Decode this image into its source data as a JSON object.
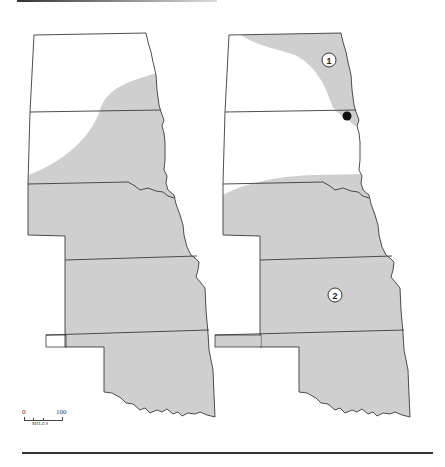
{
  "figure": {
    "type": "paired-range-map",
    "states": [
      "North Dakota",
      "South Dakota",
      "Nebraska",
      "Kansas",
      "Oklahoma"
    ],
    "colors": {
      "shaded": "#cfcfcf",
      "border": "#3a3a3a",
      "background": "#ffffff",
      "point": "#111111"
    }
  },
  "maps": [
    {
      "id": "left",
      "description": "Shaded region covering southeastern North Dakota, eastern and southern South Dakota, and all of Nebraska, Kansas and Oklahoma except the Oklahoma panhandle tip"
    },
    {
      "id": "right",
      "markers": [
        {
          "label": "1",
          "kind": "circled-number"
        },
        {
          "label": "2",
          "kind": "circled-number"
        }
      ],
      "points": [
        {
          "kind": "filled-dot",
          "location": "ND/SD border, eastern edge"
        }
      ]
    }
  ],
  "scale": {
    "min_label": "0",
    "max_label": "100",
    "units": "MILES"
  }
}
